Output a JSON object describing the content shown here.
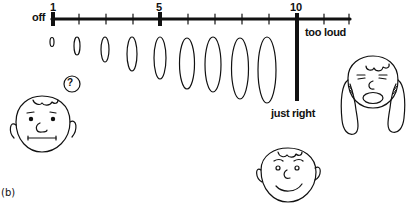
{
  "figure": {
    "panel_label": "(b)",
    "scale": {
      "start_label": "off",
      "tick_labels": [
        {
          "value": "1",
          "x": 53
        },
        {
          "value": "5",
          "x": 160
        },
        {
          "value": "10",
          "x": 297
        }
      ],
      "threshold_label": "too loud",
      "target_label": "just right"
    },
    "ovals": [
      {
        "level": 1,
        "cx": 52,
        "cy": 42,
        "rx": 2,
        "ry": 4.5
      },
      {
        "level": 2,
        "cx": 77,
        "cy": 46,
        "rx": 3,
        "ry": 9
      },
      {
        "level": 3,
        "cx": 105,
        "cy": 49.5,
        "rx": 4,
        "ry": 12.5
      },
      {
        "level": 4,
        "cx": 132,
        "cy": 54,
        "rx": 5,
        "ry": 17
      },
      {
        "level": 5,
        "cx": 160,
        "cy": 58,
        "rx": 6,
        "ry": 21
      },
      {
        "level": 6,
        "cx": 187,
        "cy": 63.5,
        "rx": 7.5,
        "ry": 25.5
      },
      {
        "level": 7,
        "cx": 213,
        "cy": 64.5,
        "rx": 8,
        "ry": 27.5
      },
      {
        "level": 8,
        "cx": 240,
        "cy": 68.5,
        "rx": 8.5,
        "ry": 30.5
      },
      {
        "level": 9,
        "cx": 267,
        "cy": 70,
        "rx": 9,
        "ry": 33
      }
    ],
    "faces": [
      {
        "id": "confused-face",
        "mood": "neutral",
        "badge": "?"
      },
      {
        "id": "happy-face",
        "mood": "smiling"
      },
      {
        "id": "loud-face",
        "mood": "covering-ears"
      }
    ]
  }
}
